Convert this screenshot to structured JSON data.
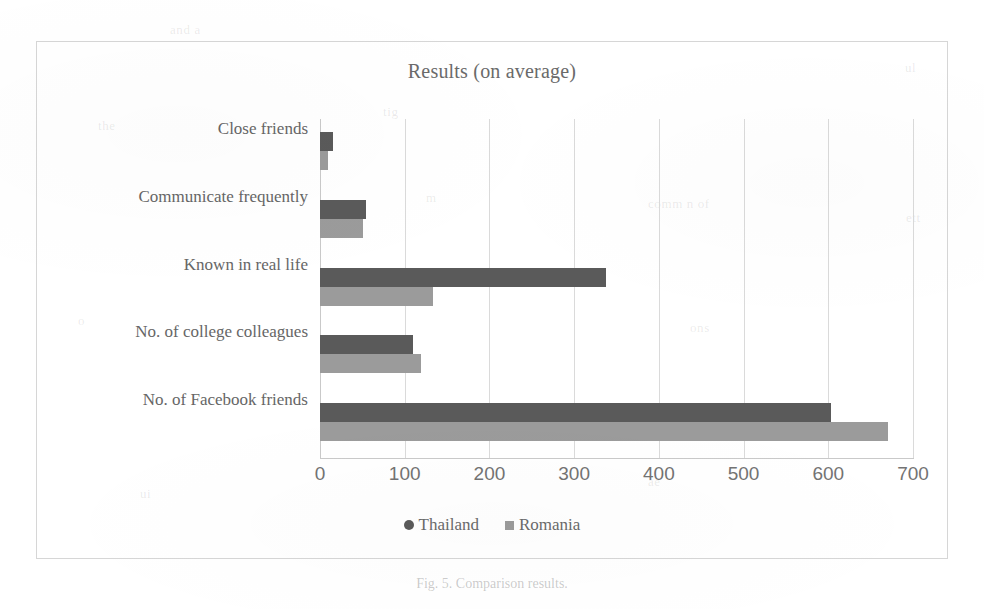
{
  "chart_data": {
    "type": "bar",
    "orientation": "horizontal",
    "title": "Results (on average)",
    "xlabel": "",
    "ylabel": "",
    "xlim": [
      0,
      700
    ],
    "xticks": [
      0,
      100,
      200,
      300,
      400,
      500,
      600,
      700
    ],
    "grid": true,
    "legend_position": "bottom",
    "categories": [
      "Close friends",
      "Communicate frequently",
      "Known in real life",
      "No. of college colleagues",
      "No. of Facebook friends"
    ],
    "series": [
      {
        "name": "Thailand",
        "color": "#5a5a5a",
        "marker": "circle",
        "values": [
          15,
          54,
          338,
          110,
          603
        ]
      },
      {
        "name": "Romania",
        "color": "#9b9b9b",
        "marker": "square",
        "values": [
          10,
          51,
          133,
          119,
          670
        ]
      }
    ]
  },
  "figure": {
    "caption": "Fig. 5.  Comparison results.",
    "border_color": "#d6d6d6",
    "background": "#ffffff"
  },
  "ghost_marks": [
    {
      "text": "and  a",
      "x": 170,
      "y": 22
    },
    {
      "text": "ul",
      "x": 905,
      "y": 60
    },
    {
      "text": "the",
      "x": 98,
      "y": 118
    },
    {
      "text": "tig",
      "x": 383,
      "y": 104
    },
    {
      "text": "m",
      "x": 426,
      "y": 190
    },
    {
      "text": "comm n of",
      "x": 648,
      "y": 196
    },
    {
      "text": "ett",
      "x": 906,
      "y": 210
    },
    {
      "text": "o",
      "x": 78,
      "y": 313
    },
    {
      "text": "ons",
      "x": 690,
      "y": 320
    },
    {
      "text": "ui",
      "x": 140,
      "y": 486
    },
    {
      "text": "ae",
      "x": 648,
      "y": 474
    }
  ]
}
